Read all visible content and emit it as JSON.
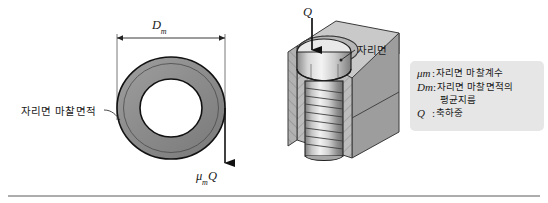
{
  "figure": {
    "caption_rule": true,
    "background_color": "#ffffff"
  },
  "left_diagram": {
    "name": "annular-seating-friction-area",
    "dimension_label": "D",
    "dimension_subscript": "m",
    "area_callout": "자리면 마찰면적",
    "force_label": "μ",
    "force_subscript": "m",
    "force_label_tail": "Q",
    "ring_fill_color": "#8c8c8c",
    "ring_outline_color": "#1a1a1a"
  },
  "center_diagram": {
    "name": "bolt-in-block-cutaway",
    "load_label": "Q",
    "seat_callout": "자리면",
    "block_top_color": "#c9c9c9",
    "block_side_color": "#9a9a9a",
    "block_hatch_color": "#b5b5b5",
    "bolt_color": "#d8d8d8"
  },
  "legend": {
    "name": "symbol-legend",
    "background_color": "#e6e6e6",
    "rows": [
      {
        "symbol": "μ",
        "subscript": "m",
        "colon": ":",
        "text": "자리면 마찰계수",
        "continuation": ""
      },
      {
        "symbol": "D",
        "subscript": "m",
        "colon": ":",
        "text": "자리면 마찰면적의",
        "continuation": "평균지름"
      },
      {
        "symbol": "Q",
        "subscript": "",
        "colon": ":",
        "text": "축하중",
        "continuation": ""
      }
    ]
  }
}
